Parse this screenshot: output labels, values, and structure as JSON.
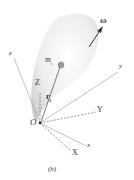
{
  "diagram": {
    "caption": "(b)",
    "labels": {
      "omega": "ω",
      "mass": "m",
      "mass_sub": "i",
      "position": "r",
      "position_sub": "i",
      "origin": "O",
      "body_x": "x",
      "body_y": "y",
      "body_z": "z",
      "inertial_X": "X",
      "inertial_Y": "Y",
      "inertial_Z": "Z"
    },
    "colors": {
      "body_fill": "#e6e6e6",
      "axis_line": "#888888",
      "mass_dot": "#999999",
      "text": "#333333"
    }
  }
}
